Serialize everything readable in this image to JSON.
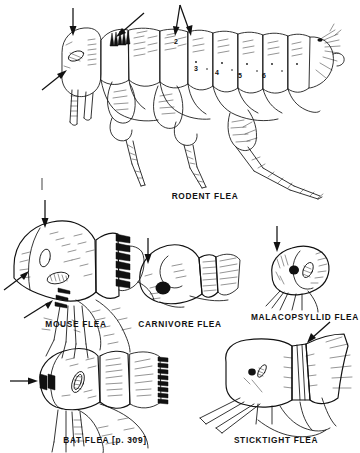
{
  "plate": {
    "kind": "scientific-line-drawing-plate",
    "subject": "flea identification figures",
    "background_color": "#ffffff",
    "ink_color": "#111111",
    "width": 360,
    "height": 453
  },
  "figures": [
    {
      "id": "rodent-flea",
      "caption": "RODENT FLEA",
      "caption_x": 205,
      "caption_y": 199,
      "segment_numbers": [
        {
          "label": "2",
          "x": 176,
          "y": 44
        },
        {
          "label": "3",
          "x": 196,
          "y": 71
        },
        {
          "label": "4",
          "x": 217,
          "y": 75
        },
        {
          "label": "5",
          "x": 240,
          "y": 78
        },
        {
          "label": "6",
          "x": 264,
          "y": 78
        }
      ],
      "pointers": [
        {
          "name": "arrow-head-vertical",
          "target": "head"
        },
        {
          "name": "arrow-pronotal-comb-diagonal",
          "target": "pronotal comb"
        },
        {
          "name": "arrow-genal-area-diagonal",
          "target": "genal area / maxilla"
        },
        {
          "name": "arrow-v-double-segment2",
          "target": "abdominal segment 2"
        }
      ]
    },
    {
      "id": "mouse-flea",
      "caption": "MOUSE FLEA",
      "caption_x": 76,
      "caption_y": 327,
      "pointers": [
        {
          "name": "arrow-vertical-head",
          "target": "head"
        },
        {
          "name": "arrow-diagonal-genal-comb",
          "target": "genal comb"
        },
        {
          "name": "arrow-diagonal-lower-spines",
          "target": "genal spines"
        }
      ]
    },
    {
      "id": "carnivore-flea",
      "caption": "CARNIVORE FLEA",
      "caption_x": 180,
      "caption_y": 327,
      "pointers": [
        {
          "name": "arrow-vertical-head",
          "target": "head front"
        }
      ]
    },
    {
      "id": "malacopsyllid-flea",
      "caption": "MALACOPSYLLID FLEA",
      "caption_x": 305,
      "caption_y": 320,
      "pointers": [
        {
          "name": "arrow-vertical-head",
          "target": "head"
        }
      ]
    },
    {
      "id": "bat-flea",
      "caption": "BAT FLEA [p. 309]",
      "caption_x": 105,
      "caption_y": 443,
      "pointers": [
        {
          "name": "arrow-horizontal-genal-comb",
          "target": "genal comb"
        }
      ]
    },
    {
      "id": "sticktight-flea",
      "caption": "STICKTIGHT FLEA",
      "caption_x": 276,
      "caption_y": 443,
      "pointers": [
        {
          "name": "arrow-diagonal-thorax",
          "target": "narrow thorax"
        }
      ]
    }
  ],
  "marks": [
    {
      "name": "scale-tick-mark",
      "x": 42,
      "y": 183
    }
  ]
}
